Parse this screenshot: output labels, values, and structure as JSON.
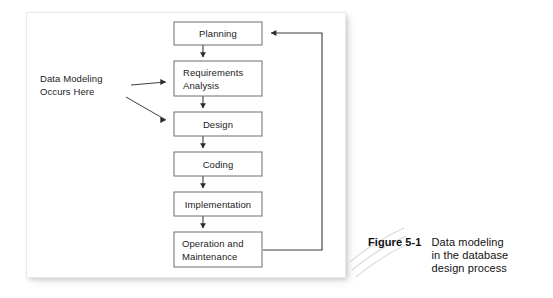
{
  "figure": {
    "panel": {
      "annotation": {
        "line1": "Data Modeling",
        "line2": "Occurs Here"
      },
      "boxes": [
        {
          "id": "planning",
          "label_line1": "Planning",
          "label_line2": ""
        },
        {
          "id": "requirements",
          "label_line1": "Requirements",
          "label_line2": "Analysis"
        },
        {
          "id": "design",
          "label_line1": "Design",
          "label_line2": ""
        },
        {
          "id": "coding",
          "label_line1": "Coding",
          "label_line2": ""
        },
        {
          "id": "implementation",
          "label_line1": "Implementation",
          "label_line2": ""
        },
        {
          "id": "operation",
          "label_line1": "Operation and",
          "label_line2": "Maintenance"
        }
      ]
    },
    "caption": {
      "number": "Figure 5-1",
      "line1": "Data modeling",
      "line2": "in the database",
      "line3": "design process"
    }
  },
  "colors": {
    "box_stroke": "#6e6e6e",
    "line": "#3a3a3a",
    "text": "#1b1b1b",
    "panel_bg": "#ffffff",
    "page_bg": "#ffffff"
  }
}
